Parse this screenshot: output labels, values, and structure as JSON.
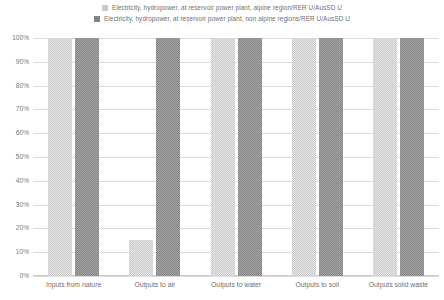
{
  "chart_data": {
    "type": "bar",
    "title": "",
    "xlabel": "",
    "ylabel": "",
    "ylim": [
      0,
      100
    ],
    "ytick_labels": [
      "100%",
      "90%",
      "80%",
      "70%",
      "60%",
      "50%",
      "40%",
      "30%",
      "20%",
      "10%",
      "0%"
    ],
    "ytick_values": [
      100,
      90,
      80,
      70,
      60,
      50,
      40,
      30,
      20,
      10,
      0
    ],
    "grid": true,
    "legend_position": "top",
    "categories": [
      "Inputs from nature",
      "Outputs to air",
      "Outputs to water",
      "Outputs to soil",
      "Outputs solid waste"
    ],
    "series": [
      {
        "name": "Electricity, hydropower, at reservoir power plant, alpine region/RER U/AusSD U",
        "color": "#c9c9c9",
        "values": [
          100,
          15,
          100,
          100,
          100
        ]
      },
      {
        "name": "Electricity, hydropower, at reservoir power plant, non alpine regions/RER U/AusSD U",
        "color": "#848484",
        "values": [
          100,
          100,
          100,
          100,
          100
        ]
      }
    ]
  }
}
